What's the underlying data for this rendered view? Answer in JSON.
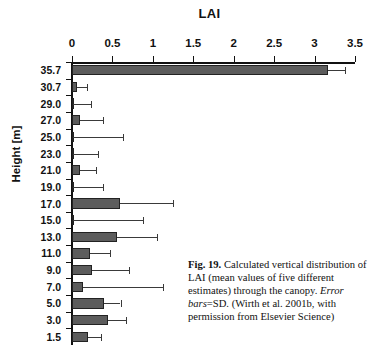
{
  "figure": {
    "number_label": "Fig. 19.",
    "caption_text": "Calculated vertical distribution of LAI (mean values of five different estimates) through the canopy. ",
    "caption_italic": "Error bars",
    "caption_text2": "=SD. (Wirth et al. 2001b, with permission from Elsevier Science)"
  },
  "chart_data": {
    "type": "bar",
    "orientation": "horizontal",
    "title": "LAI",
    "xlabel": "LAI",
    "ylabel": "Height [m]",
    "xlim": [
      0,
      3.5
    ],
    "xticks": [
      0,
      0.5,
      1,
      1.5,
      2,
      2.5,
      3,
      3.5
    ],
    "xticklabels": [
      "0",
      "0.5",
      "1",
      "1.5",
      "2",
      "2.5",
      "3",
      "3.5"
    ],
    "grid": false,
    "legend": null,
    "categories": [
      "35.7",
      "30.7",
      "29.0",
      "27.0",
      "25.0",
      "23.0",
      "21.0",
      "19.0",
      "17.0",
      "15.0",
      "13.0",
      "11.0",
      "9.0",
      "7.0",
      "5.0",
      "3.0",
      "1.5"
    ],
    "values": [
      3.17,
      0.06,
      0.01,
      0.1,
      0.01,
      0.005,
      0.1,
      0.005,
      0.59,
      0.01,
      0.56,
      0.22,
      0.25,
      0.13,
      0.4,
      0.45,
      0.2
    ],
    "errors_upper": [
      3.38,
      0.18,
      0.23,
      0.38,
      0.63,
      0.32,
      0.3,
      0.38,
      1.25,
      0.88,
      1.05,
      0.47,
      0.7,
      1.12,
      0.6,
      0.67,
      0.36
    ],
    "bar_color": "#5c5c5c",
    "axis_color": "#111111"
  }
}
